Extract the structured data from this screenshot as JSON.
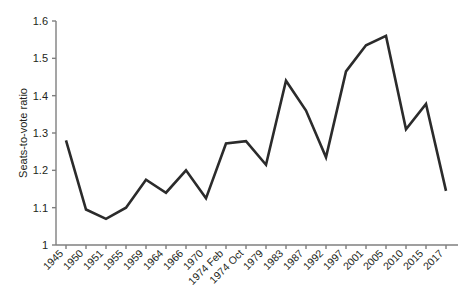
{
  "chart_data": {
    "type": "line",
    "title": "",
    "xlabel": "",
    "ylabel": "Seats-to-vote ratio",
    "ylim": [
      1,
      1.6
    ],
    "y_ticks": [
      "1",
      "1.1",
      "1.2",
      "1.3",
      "1.4",
      "1.5",
      "1.6"
    ],
    "y_tick_values": [
      1,
      1.1,
      1.2,
      1.3,
      1.4,
      1.5,
      1.6
    ],
    "grid": false,
    "legend": "none",
    "categories": [
      "1945",
      "1950",
      "1951",
      "1955",
      "1959",
      "1964",
      "1966",
      "1970",
      "1974 Feb",
      "1974 Oct",
      "1979",
      "1983",
      "1987",
      "1992",
      "1997",
      "2001",
      "2005",
      "2010",
      "2015",
      "2017"
    ],
    "values": [
      1.28,
      1.095,
      1.07,
      1.1,
      1.175,
      1.14,
      1.2,
      1.125,
      1.272,
      1.278,
      1.215,
      1.44,
      1.36,
      1.235,
      1.465,
      1.535,
      1.56,
      1.31,
      1.378,
      1.145
    ],
    "series": [
      {
        "name": "Seats-to-vote ratio",
        "values": [
          1.28,
          1.095,
          1.07,
          1.1,
          1.175,
          1.14,
          1.2,
          1.125,
          1.272,
          1.278,
          1.215,
          1.44,
          1.36,
          1.235,
          1.465,
          1.535,
          1.56,
          1.31,
          1.378,
          1.145
        ]
      }
    ],
    "colors": {
      "line": "#2b2b2b",
      "axis": "#7f7f7f",
      "text": "#231f20",
      "background": "#ffffff"
    }
  }
}
